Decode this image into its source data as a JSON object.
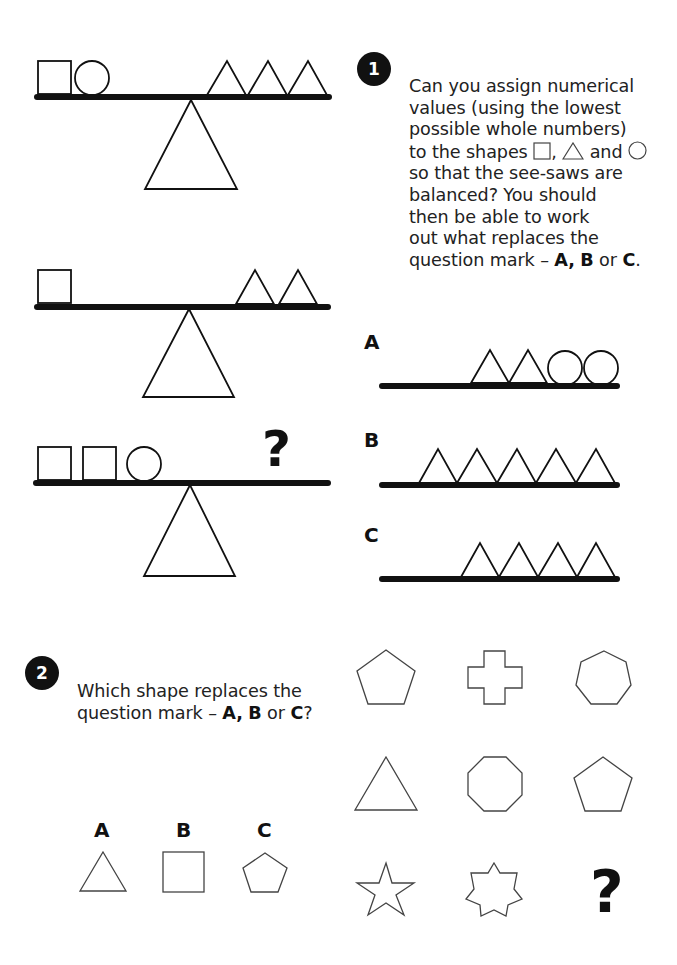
{
  "q1": {
    "number": "1",
    "text_lines": [
      "Can you assign numerical",
      "values (using the lowest",
      "possible whole numbers)",
      "to the shapes",
      "so that the see-saws are",
      "balanced? You should",
      "then be able to work",
      "out what replaces the",
      "question mark –"
    ],
    "inline_and": "and",
    "inline_comma": ",",
    "inline_or": "or",
    "opt_A": "A,",
    "opt_B": "B",
    "opt_C": "C",
    "end_period": ".",
    "question_mark": "?",
    "seesaws": [
      {
        "left": [
          "square",
          "circle"
        ],
        "right": [
          "triangle",
          "triangle",
          "triangle"
        ]
      },
      {
        "left": [
          "square"
        ],
        "right": [
          "triangle",
          "triangle"
        ]
      },
      {
        "left": [
          "square",
          "square",
          "circle"
        ],
        "right": [
          "?"
        ]
      }
    ],
    "options": [
      {
        "label": "A",
        "items": [
          "triangle",
          "triangle",
          "circle",
          "circle"
        ]
      },
      {
        "label": "B",
        "items": [
          "triangle",
          "triangle",
          "triangle",
          "triangle",
          "triangle"
        ]
      },
      {
        "label": "C",
        "items": [
          "triangle",
          "triangle",
          "triangle",
          "triangle"
        ]
      }
    ]
  },
  "q2": {
    "number": "2",
    "line1": "Which shape replaces the",
    "line2": "question mark –",
    "opt_A": "A,",
    "opt_B": "B",
    "or": "or",
    "opt_C": "C",
    "end": "?",
    "grid": [
      [
        "pentagon",
        "cross",
        "heptagon"
      ],
      [
        "triangle",
        "octagon",
        "pentagon"
      ],
      [
        "5-point star",
        "7-point star",
        "?"
      ]
    ],
    "question_mark": "?",
    "options": [
      {
        "label": "A",
        "shape": "triangle"
      },
      {
        "label": "B",
        "shape": "square"
      },
      {
        "label": "C",
        "shape": "pentagon"
      }
    ]
  }
}
